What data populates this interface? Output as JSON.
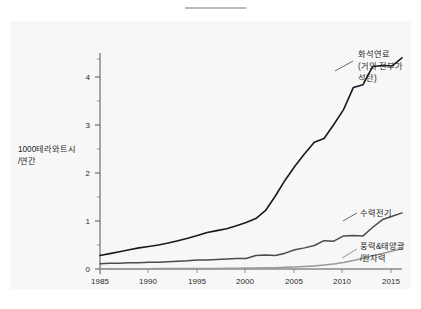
{
  "page": {
    "background_color": "#ffffff",
    "panel_color": "#f7f7f7",
    "top_rule_color": "#b9b9b9"
  },
  "chart_data": {
    "type": "line",
    "title": "",
    "subtitle": "",
    "xlabel": "",
    "ylabel": "1000테라와트시\n/연간",
    "ylabel_line1": "1000테라와트시",
    "ylabel_line2": "/연간",
    "xlim": [
      1985,
      2016
    ],
    "ylim": [
      0,
      4.5
    ],
    "x_ticks": [
      1985,
      1990,
      1995,
      2000,
      2005,
      2010,
      2015
    ],
    "x_tick_labels": [
      "1985",
      "1990",
      "1995",
      "2000",
      "2005",
      "2010",
      "2015"
    ],
    "y_ticks": [
      0,
      1,
      2,
      3,
      4
    ],
    "y_tick_labels": [
      "0",
      "1",
      "2",
      "3",
      "4"
    ],
    "y_minor_ticks": [
      0.5,
      1.5,
      2.5,
      3.5
    ],
    "grid": false,
    "legend_position": "right-inline-annotations",
    "x": [
      1985,
      1986,
      1987,
      1988,
      1989,
      1990,
      1991,
      1992,
      1993,
      1994,
      1995,
      1996,
      1997,
      1998,
      1999,
      2000,
      2001,
      2002,
      2003,
      2004,
      2005,
      2006,
      2007,
      2008,
      2009,
      2010,
      2011,
      2012,
      2013,
      2014,
      2015,
      2016
    ],
    "series": [
      {
        "name": "화석연료\n(거의 전부가\n석탄)",
        "label_line1": "화석연료",
        "label_line2": "(거의 전부가",
        "label_line3": "석탄)",
        "color": "#1a1a1a",
        "width": 1.6,
        "values": [
          0.28,
          0.32,
          0.36,
          0.4,
          0.44,
          0.47,
          0.5,
          0.54,
          0.59,
          0.64,
          0.7,
          0.76,
          0.8,
          0.84,
          0.9,
          0.97,
          1.05,
          1.22,
          1.52,
          1.85,
          2.14,
          2.4,
          2.64,
          2.72,
          3.01,
          3.32,
          3.78,
          3.84,
          4.22,
          4.24,
          4.23,
          4.4
        ]
      },
      {
        "name": "수력전기",
        "label_line1": "수력전기",
        "color": "#4a4a4a",
        "width": 1.5,
        "values": [
          0.11,
          0.12,
          0.12,
          0.13,
          0.13,
          0.14,
          0.14,
          0.15,
          0.16,
          0.17,
          0.19,
          0.19,
          0.2,
          0.21,
          0.22,
          0.22,
          0.28,
          0.29,
          0.28,
          0.33,
          0.4,
          0.44,
          0.49,
          0.59,
          0.58,
          0.69,
          0.7,
          0.69,
          0.87,
          1.03,
          1.1,
          1.17
        ]
      },
      {
        "name": "풍력&태양광\n/원자력",
        "label_line1": "풍력&태양광",
        "label_line2": "/원자력",
        "color": "#9a9a9a",
        "width": 1.5,
        "values": [
          0.005,
          0.005,
          0.006,
          0.006,
          0.007,
          0.007,
          0.008,
          0.008,
          0.009,
          0.01,
          0.011,
          0.012,
          0.013,
          0.015,
          0.017,
          0.019,
          0.021,
          0.024,
          0.028,
          0.034,
          0.042,
          0.052,
          0.065,
          0.082,
          0.105,
          0.135,
          0.175,
          0.225,
          0.275,
          0.325,
          0.375,
          0.42
        ]
      }
    ]
  }
}
